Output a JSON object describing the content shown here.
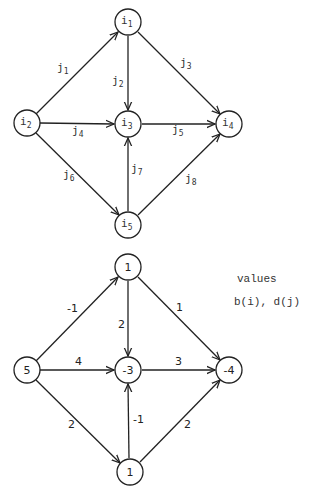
{
  "top_graph": {
    "nodes": [
      {
        "id": "i1",
        "base": "i",
        "sub": "1",
        "x": 128,
        "y": 22
      },
      {
        "id": "i2",
        "base": "i",
        "sub": "2",
        "x": 27,
        "y": 123
      },
      {
        "id": "i3",
        "base": "i",
        "sub": "3",
        "x": 128,
        "y": 124
      },
      {
        "id": "i4",
        "base": "i",
        "sub": "4",
        "x": 229,
        "y": 124
      },
      {
        "id": "i5",
        "base": "i",
        "sub": "5",
        "x": 128,
        "y": 225
      }
    ],
    "edges": [
      {
        "id": "j1",
        "base": "j",
        "sub": "1",
        "from": "i2",
        "to": "i1"
      },
      {
        "id": "j2",
        "base": "j",
        "sub": "2",
        "from": "i1",
        "to": "i3"
      },
      {
        "id": "j3",
        "base": "j",
        "sub": "3",
        "from": "i1",
        "to": "i4"
      },
      {
        "id": "j4",
        "base": "j",
        "sub": "4",
        "from": "i2",
        "to": "i3"
      },
      {
        "id": "j5",
        "base": "j",
        "sub": "5",
        "from": "i3",
        "to": "i4"
      },
      {
        "id": "j6",
        "base": "j",
        "sub": "6",
        "from": "i2",
        "to": "i5"
      },
      {
        "id": "j7",
        "base": "j",
        "sub": "7",
        "from": "i5",
        "to": "i3"
      },
      {
        "id": "j8",
        "base": "j",
        "sub": "8",
        "from": "i5",
        "to": "i4"
      }
    ]
  },
  "bottom_graph": {
    "nodes": [
      {
        "id": "i1",
        "value": "1"
      },
      {
        "id": "i2",
        "value": "5"
      },
      {
        "id": "i3",
        "value": "-3"
      },
      {
        "id": "i4",
        "value": "-4"
      },
      {
        "id": "i5",
        "value": "1"
      }
    ],
    "edges": [
      {
        "id": "j1",
        "value": "-1"
      },
      {
        "id": "j2",
        "value": "2"
      },
      {
        "id": "j3",
        "value": "1"
      },
      {
        "id": "j4",
        "value": "4"
      },
      {
        "id": "j5",
        "value": "3"
      },
      {
        "id": "j6",
        "value": "2"
      },
      {
        "id": "j7",
        "value": "-1"
      },
      {
        "id": "j8",
        "value": "2"
      }
    ]
  },
  "legend": {
    "line1": "values",
    "line2": "b(i), d(j)"
  }
}
